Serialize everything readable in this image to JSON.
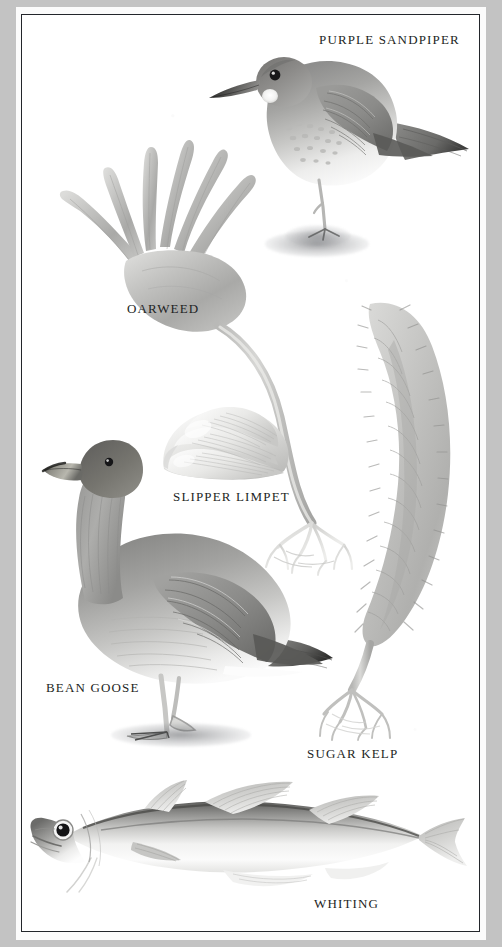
{
  "plate": {
    "type": "natural-history-illustration-plate",
    "background_color": "#c3c3c3",
    "mat_color": "#fbfbfb",
    "paper_color": "#ffffff",
    "border_color": "#23262b",
    "ink_color": "#1d1f24"
  },
  "specimens": [
    {
      "id": "purple-sandpiper",
      "label": "PURPLE SANDPIPER",
      "kind": "bird",
      "label_position": {
        "x": 318,
        "y": 32
      }
    },
    {
      "id": "oarweed",
      "label": "OARWEED",
      "kind": "seaweed",
      "label_position": {
        "x": 126,
        "y": 301
      }
    },
    {
      "id": "slipper-limpet",
      "label": "SLIPPER LIMPET",
      "kind": "mollusc",
      "label_position": {
        "x": 172,
        "y": 489
      }
    },
    {
      "id": "bean-goose",
      "label": "BEAN GOOSE",
      "kind": "bird",
      "label_position": {
        "x": 45,
        "y": 680
      }
    },
    {
      "id": "sugar-kelp",
      "label": "SUGAR KELP",
      "kind": "seaweed",
      "label_position": {
        "x": 306,
        "y": 746
      }
    },
    {
      "id": "whiting",
      "label": "WHITING",
      "kind": "fish",
      "label_position": {
        "x": 313,
        "y": 896
      }
    }
  ]
}
